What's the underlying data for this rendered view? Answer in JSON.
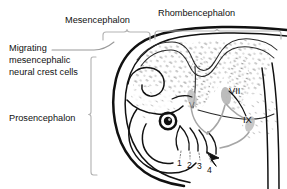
{
  "figure": {
    "background_color": "#ffffff",
    "ink_color": "#111111",
    "stipple_color": "#9a9a9a",
    "bracket_color": "#b4b4b4",
    "leader_color": "#9a9a9a"
  },
  "labels": {
    "mesencephalon": "Mesencephalon",
    "rhombencephalon": "Rhombencephalon",
    "prosencephalon": "Prosencephalon",
    "migrating_line1": "Migrating",
    "migrating_line2": "mesencephalic",
    "migrating_line3": "neural crest cells",
    "ganglion_v": "V",
    "ganglion_vii": "VII",
    "ganglion_ix": "IX",
    "arch_1": "1",
    "arch_2": "2",
    "arch_3": "3",
    "arch_4": "4"
  },
  "brackets": [
    {
      "name": "mesencephalon-bracket",
      "orientation": "horizontal",
      "span_px": [
        103,
        150
      ],
      "y_px": 32
    },
    {
      "name": "rhombencephalon-bracket",
      "orientation": "horizontal",
      "span_px": [
        155,
        281
      ],
      "y_px": 31
    },
    {
      "name": "prosencephalon-bracket",
      "orientation": "vertical",
      "span_px": [
        57,
        175
      ],
      "x_px": 91
    }
  ],
  "leaders": [
    {
      "name": "migrating-leader",
      "from_px": [
        52,
        50
      ],
      "to_px": [
        105,
        44
      ]
    }
  ],
  "regions": [
    {
      "name": "mesencephalon-region",
      "label": "Mesencephalon"
    },
    {
      "name": "rhombencephalon-region",
      "label": "Rhombencephalon"
    },
    {
      "name": "prosencephalon-region",
      "label": "Prosencephalon"
    }
  ],
  "pharyngeal_arches": [
    "1",
    "2",
    "3",
    "4"
  ],
  "cranial_ganglia": [
    "V",
    "VII",
    "IX"
  ]
}
